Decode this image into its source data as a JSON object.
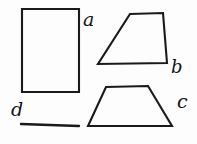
{
  "figure": {
    "background_color": "#fdfdfd",
    "ink_color": "#1a1a1a",
    "width": 197,
    "height": 144,
    "labels": {
      "a": "a",
      "b": "b",
      "c": "c",
      "d": "d"
    },
    "shapes": [
      {
        "id": "rectangle-a",
        "label": "a",
        "kind": "rectangle",
        "points": "22,9 79,9 79,92 22,92"
      },
      {
        "id": "trapezoid-b",
        "label": "b",
        "kind": "trapezoid",
        "points": "130,14 163,13 167,63 98,64"
      },
      {
        "id": "trapezoid-c",
        "label": "c",
        "kind": "trapezoid",
        "points": "106,87 148,86 172,126 88,126"
      },
      {
        "id": "segment-d",
        "label": "d",
        "kind": "line-segment",
        "x1": 21,
        "y1": 124,
        "x2": 79,
        "y2": 126
      }
    ]
  }
}
